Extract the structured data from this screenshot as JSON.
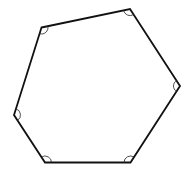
{
  "diagram": {
    "shape": "hexagon",
    "stroke_color": "#111111",
    "arc_color": "#222222",
    "fill_color": "#ffffff",
    "vertices": [
      {
        "x": 41.5,
        "y": 27.5
      },
      {
        "x": 130,
        "y": 9
      },
      {
        "x": 180,
        "y": 86
      },
      {
        "x": 130.5,
        "y": 162.5
      },
      {
        "x": 45,
        "y": 162.5
      },
      {
        "x": 14,
        "y": 115
      }
    ],
    "angle_marks": 6,
    "arc_radius": 6.5
  }
}
